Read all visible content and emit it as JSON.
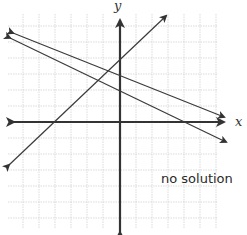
{
  "diagram": {
    "type": "coordinate-plane-graph",
    "caption": "no solution",
    "axes": {
      "x_label": "x",
      "y_label": "y"
    },
    "colors": {
      "grid": "#cfcfcf",
      "axis": "#333333",
      "line": "#3a3a3a",
      "text": "#2a2a2a"
    },
    "lines": [
      {
        "name": "rising-line",
        "slope_sign": "positive",
        "description": "line with positive slope, arrows at both ends"
      },
      {
        "name": "falling-line-upper",
        "slope_sign": "negative",
        "description": "upper decreasing line, arrows at both ends"
      },
      {
        "name": "falling-line-lower",
        "slope_sign": "negative",
        "description": "lower decreasing line, arrows at both ends"
      }
    ]
  }
}
